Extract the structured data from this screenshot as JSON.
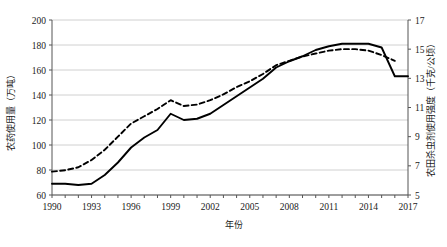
{
  "chart_data": {
    "type": "line",
    "title": "",
    "xlabel": "年份",
    "ylabel": "农药使用量（万吨）",
    "y2label": "农田杀虫剂使用强度（千克/公顷）",
    "xlim": [
      1990,
      2017
    ],
    "ylim": [
      60,
      200
    ],
    "y2lim": [
      5,
      17
    ],
    "grid": true,
    "legend_position": "none",
    "xticks": [
      "1990",
      "1993",
      "1996",
      "1999",
      "2002",
      "2005",
      "2008",
      "2011",
      "2014",
      "2017"
    ],
    "xtick_values": [
      1990,
      1993,
      1996,
      1999,
      2002,
      2005,
      2008,
      2011,
      2014,
      2017
    ],
    "yticks": [
      "60",
      "80",
      "100",
      "120",
      "140",
      "160",
      "180",
      "200"
    ],
    "ytick_values": [
      60,
      80,
      100,
      120,
      140,
      160,
      180,
      200
    ],
    "y2ticks": [
      "5",
      "7",
      "9",
      "11",
      "13",
      "15",
      "17"
    ],
    "y2tick_values": [
      5,
      7,
      9,
      11,
      13,
      15,
      17
    ],
    "x": [
      1990,
      1991,
      1992,
      1993,
      1994,
      1995,
      1996,
      1997,
      1998,
      1999,
      2000,
      2001,
      2002,
      2003,
      2004,
      2005,
      2006,
      2007,
      2008,
      2009,
      2010,
      2011,
      2012,
      2013,
      2014,
      2015,
      2016,
      2017
    ],
    "series": [
      {
        "name": "农药使用量（万吨）",
        "axis": "left",
        "style": "solid",
        "color": "#000000",
        "values": [
          69,
          69,
          68,
          69,
          76,
          86,
          98,
          106,
          112,
          125,
          120,
          121,
          125,
          132,
          139,
          146,
          153,
          162,
          167,
          171,
          176,
          179,
          181,
          181,
          181,
          178,
          155,
          155
        ]
      },
      {
        "name": "农田杀虫剂使用强度（千克/公顷）",
        "axis": "right",
        "style": "dashed",
        "color": "#000000",
        "values": [
          6.6,
          6.7,
          6.9,
          7.4,
          8.1,
          9.0,
          9.9,
          10.4,
          10.9,
          11.5,
          11.1,
          11.2,
          11.5,
          11.9,
          12.4,
          12.8,
          13.3,
          13.9,
          14.2,
          14.5,
          14.7,
          14.9,
          15.0,
          15.0,
          14.9,
          14.6,
          14.2,
          null
        ]
      }
    ]
  },
  "axes": {
    "left_title": "农药使用量（万吨）",
    "right_title": "农田杀虫剂使用强度（千克/公顷）",
    "bottom_title": "年份"
  }
}
